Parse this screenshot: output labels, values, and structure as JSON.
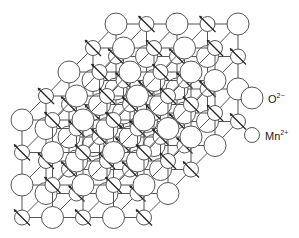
{
  "diagram": {
    "stroke_color": "#555555",
    "fill_color": "#ffffff",
    "oxygen_radius": 11,
    "manganese_radius": 7.5,
    "layers": [
      {
        "offset_x": 94,
        "offset_y": -96
      },
      {
        "offset_x": 71,
        "offset_y": -72
      },
      {
        "offset_x": 47,
        "offset_y": -48
      },
      {
        "offset_x": 24,
        "offset_y": -24
      },
      {
        "offset_x": 0,
        "offset_y": 0
      }
    ],
    "grid": {
      "cols": 5,
      "rows": 4,
      "origin_x": 22,
      "origin_y": 120,
      "dx": 30.5,
      "dy": 32.5
    }
  },
  "legend": {
    "items": [
      {
        "ion": "O",
        "charge": "2−",
        "radius": 11
      },
      {
        "ion": "Mn",
        "charge": "2+",
        "radius": 7.5
      }
    ]
  }
}
